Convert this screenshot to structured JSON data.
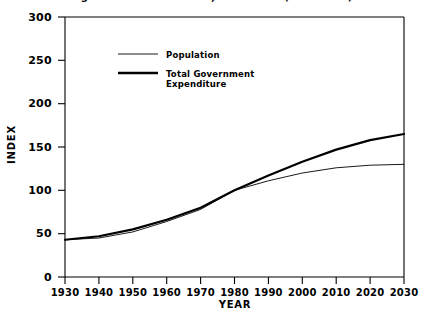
{
  "chart_data": {
    "type": "line",
    "title": "of government combined, 1930-2030 (1980=100)",
    "xlabel": "YEAR",
    "ylabel": "INDEX",
    "xlim": [
      1930,
      2030
    ],
    "ylim": [
      0,
      300
    ],
    "grid": false,
    "legend_position": "upper-left-inside",
    "x": [
      1930,
      1940,
      1950,
      1960,
      1970,
      1980,
      1990,
      2000,
      2010,
      2020,
      2030
    ],
    "xticks": [
      "1930",
      "1940",
      "1950",
      "1960",
      "1970",
      "1980",
      "1990",
      "2000",
      "2010",
      "2020",
      "2030"
    ],
    "yticks": [
      "0",
      "50",
      "100",
      "150",
      "200",
      "250",
      "300"
    ],
    "series": [
      {
        "name": "Population",
        "values": [
          43,
          45,
          52,
          64,
          78,
          100,
          111,
          120,
          126,
          129,
          130
        ],
        "line_width": "thin"
      },
      {
        "name": "Total Government Expenditure",
        "values": [
          43,
          47,
          55,
          66,
          80,
          100,
          117,
          133,
          147,
          158,
          165
        ],
        "line_width": "thick"
      }
    ]
  },
  "legend": {
    "entries": [
      {
        "label": "Population"
      },
      {
        "label": "Total Government\nExpenditure"
      }
    ]
  }
}
